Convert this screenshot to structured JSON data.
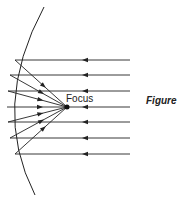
{
  "diagram": {
    "type": "concave-mirror-ray-diagram",
    "focus_label": "Focus",
    "figure_label": "Figure",
    "colors": {
      "line": "#222222",
      "background": "#ffffff"
    },
    "mirror": {
      "top": [
        44,
        7
      ],
      "mid": [
        7,
        107
      ],
      "bottom": [
        35,
        195
      ]
    },
    "focus_point": [
      67,
      107
    ],
    "rays": [
      {
        "y": 60,
        "mirror_x": 15
      },
      {
        "y": 75,
        "mirror_x": 10
      },
      {
        "y": 91,
        "mirror_x": 8
      },
      {
        "y": 107,
        "mirror_x": 7
      },
      {
        "y": 122,
        "mirror_x": 8
      },
      {
        "y": 138,
        "mirror_x": 10
      },
      {
        "y": 154,
        "mirror_x": 15
      }
    ],
    "ray_right_x": 130,
    "incoming_arrow_x": 85
  }
}
